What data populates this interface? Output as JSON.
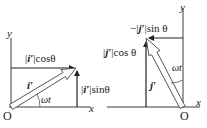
{
  "figure": {
    "colors": {
      "line": "#3a3a3a",
      "arrow_fill": "#ffffff",
      "text": "#222222",
      "background": "#ffffff"
    },
    "left_panel": {
      "y_axis_label": "y",
      "x_axis_label": "x",
      "origin_label": "O",
      "vector_label": "i′",
      "angle_label": "ωt",
      "horizontal_component": {
        "prefix": "|",
        "vec": "i′",
        "suffix": "|cosθ"
      },
      "vertical_component": {
        "prefix": "|",
        "vec": "i′",
        "suffix": "|sinθ"
      }
    },
    "right_panel": {
      "y_axis_label": "y",
      "x_axis_label": "x",
      "origin_label": "O",
      "vector_label": "j′",
      "angle_label": "ωt",
      "horizontal_component": {
        "prefix": "−|",
        "vec": "j′",
        "suffix": "|sin θ"
      },
      "vertical_component": {
        "prefix": "|",
        "vec": "j′",
        "suffix": "|cos θ"
      }
    }
  }
}
